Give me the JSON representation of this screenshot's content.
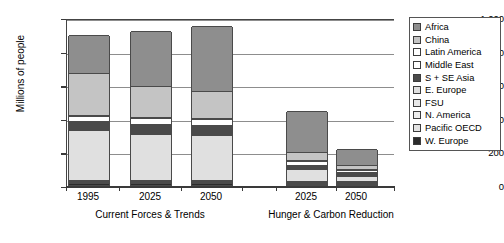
{
  "chart_data": {
    "type": "bar",
    "subtype": "stacked-vertical",
    "title": "",
    "xlabel": "",
    "ylabel": "Millions of people",
    "ylim": [
      0,
      1000
    ],
    "yticks": [
      0,
      200,
      400,
      600,
      800,
      1000
    ],
    "ytick_labels": [
      "0",
      "200",
      "400",
      "600",
      "800",
      "1,000"
    ],
    "grid": true,
    "legend_position": "right",
    "categories": [
      "1995",
      "2025",
      "2050",
      "2025",
      "2050"
    ],
    "groups": [
      {
        "label": "Current Forces & Trends",
        "categories": [
          "1995",
          "2025",
          "2050"
        ]
      },
      {
        "label": "Hunger & Carbon Reduction",
        "categories": [
          "2025",
          "2050"
        ]
      }
    ],
    "stack_order_bottom_to_top": [
      "W. Europe",
      "Pacific OECD",
      "N. America",
      "FSU",
      "E. Europe",
      "S + SE Asia",
      "Middle East",
      "Latin America",
      "China",
      "Africa"
    ],
    "series": [
      {
        "name": "W. Europe",
        "color": "#2b2b2b",
        "values": [
          10,
          10,
          10,
          8,
          8
        ]
      },
      {
        "name": "Pacific OECD",
        "color": "#e3e3e3",
        "values": [
          8,
          8,
          8,
          6,
          6
        ]
      },
      {
        "name": "N. America",
        "color": "#ededed",
        "values": [
          6,
          6,
          6,
          5,
          5
        ]
      },
      {
        "name": "FSU",
        "color": "#e8e8e8",
        "values": [
          6,
          6,
          6,
          5,
          5
        ]
      },
      {
        "name": "E. Europe",
        "color": "#e0e0e0",
        "values": [
          300,
          272,
          265,
          72,
          32
        ]
      },
      {
        "name": "S + SE Asia",
        "color": "#4a4a4a",
        "values": [
          50,
          62,
          62,
          26,
          22
        ]
      },
      {
        "name": "Middle East",
        "color": "#ffffff",
        "values": [
          28,
          32,
          36,
          20,
          14
        ]
      },
      {
        "name": "Latin America",
        "color": "#ffffff",
        "values": [
          6,
          6,
          6,
          4,
          4
        ]
      },
      {
        "name": "China",
        "color": "#c4c4c4",
        "values": [
          252,
          188,
          163,
          48,
          26
        ]
      },
      {
        "name": "Africa",
        "color": "#8e8e8e",
        "values": [
          229,
          325,
          383,
          246,
          93
        ]
      }
    ],
    "totals": [
      895,
      915,
      945,
      440,
      215
    ]
  },
  "legend": {
    "items": [
      {
        "label": "Africa",
        "color": "#8e8e8e"
      },
      {
        "label": "China",
        "color": "#c4c4c4"
      },
      {
        "label": "Latin America",
        "color": "#ffffff"
      },
      {
        "label": "Middle East",
        "color": "#ffffff"
      },
      {
        "label": "S + SE Asia",
        "color": "#4a4a4a"
      },
      {
        "label": "E. Europe",
        "color": "#e0e0e0"
      },
      {
        "label": "FSU",
        "color": "#e8e8e8"
      },
      {
        "label": "N. America",
        "color": "#ededed"
      },
      {
        "label": "Pacific OECD",
        "color": "#e3e3e3"
      },
      {
        "label": "W. Europe",
        "color": "#2b2b2b"
      }
    ]
  }
}
